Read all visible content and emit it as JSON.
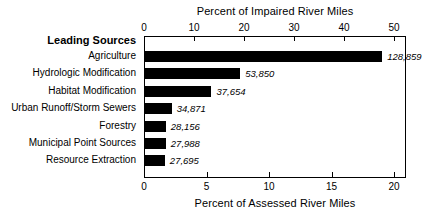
{
  "chart_data": {
    "type": "bar",
    "orientation": "horizontal",
    "title": "",
    "top_axis": {
      "label": "Percent of Impaired River Miles",
      "ticks": [
        0,
        10,
        20,
        30,
        40,
        50
      ],
      "lim": [
        0,
        52.4
      ]
    },
    "bottom_axis": {
      "label": "Percent of Assessed River Miles",
      "ticks": [
        0,
        5,
        10,
        15,
        20
      ],
      "lim": [
        0,
        20.96
      ]
    },
    "category_header": "Leading Sources",
    "categories": [
      "Agriculture",
      "Hydrologic Modification",
      "Habitat Modification",
      "Urban Runoff/Storm Sewers",
      "Forestry",
      "Municipal Point Sources",
      "Resource Extraction"
    ],
    "values_percent_impaired": [
      47.8,
      19.2,
      13.4,
      5.4,
      4.2,
      4.2,
      4.0
    ],
    "values_percent_assessed": [
      19.1,
      7.7,
      5.4,
      2.2,
      1.7,
      1.7,
      1.6
    ],
    "data_labels": [
      "128,859",
      "53,850",
      "37,654",
      "34,871",
      "28,156",
      "27,988",
      "27,695"
    ],
    "grid": false,
    "legend": "none",
    "bar_color": "#000000"
  }
}
